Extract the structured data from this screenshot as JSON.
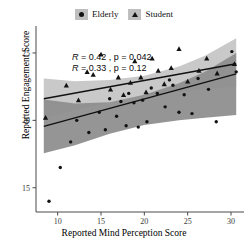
{
  "legend": {
    "entries": [
      {
        "label": "Elderly",
        "marker": "circle-marker-icon",
        "color": "#121212",
        "key_bg": "#bfbfbf"
      },
      {
        "label": "Student",
        "marker": "triangle-marker-icon",
        "color": "#121212",
        "key_bg": "#bfbfbf"
      }
    ]
  },
  "annotations": [
    {
      "text": "R = 0.42 , p = 0.042",
      "r": 0.42,
      "p": 0.042,
      "group": "Student"
    },
    {
      "text": "R = 0.33 , p = 0.12",
      "r": 0.33,
      "p": 0.12,
      "group": "Elderly"
    }
  ],
  "axes": {
    "xlabel": "Reported Mind Perception Score",
    "ylabel": "Reported Engagement Score",
    "xticks": [
      10,
      15,
      20,
      25,
      30
    ],
    "yticks": [
      15,
      20,
      25
    ],
    "xlim": [
      7.5,
      31.5
    ],
    "ylim": [
      13.2,
      27.0
    ]
  },
  "chart_data": {
    "type": "scatter",
    "title": "",
    "xlabel": "Reported Mind Perception Score",
    "ylabel": "Reported Engagement Score",
    "xlim": [
      7.5,
      31.5
    ],
    "ylim": [
      13.2,
      27.0
    ],
    "xticks": [
      10,
      15,
      20,
      25,
      30
    ],
    "yticks": [
      15,
      20,
      25
    ],
    "grid": false,
    "legend_position": "top-center",
    "series": [
      {
        "name": "Elderly",
        "marker": "circle",
        "color": "#121212",
        "band_color": "#8f8f8f",
        "line_color": "#111111",
        "r": 0.33,
        "p": 0.12,
        "fit_line": {
          "x": [
            8.4,
            30.6
          ],
          "y": [
            19.55,
            23.45
          ]
        },
        "band_upper": {
          "x": [
            8.4,
            12.0,
            16.0,
            20.0,
            24.0,
            27.0,
            30.6
          ],
          "y": [
            21.55,
            21.25,
            21.35,
            21.9,
            22.75,
            23.6,
            25.0
          ]
        },
        "band_lower": {
          "x": [
            8.4,
            12.0,
            16.0,
            20.0,
            24.0,
            27.0,
            30.6
          ],
          "y": [
            17.55,
            18.15,
            19.0,
            19.65,
            20.0,
            20.2,
            20.4
          ]
        },
        "points": [
          [
            9.0,
            14.0
          ],
          [
            10.3,
            16.5
          ],
          [
            11.5,
            18.4
          ],
          [
            12.2,
            20.0
          ],
          [
            13.6,
            19.1
          ],
          [
            14.8,
            20.6
          ],
          [
            15.5,
            19.3
          ],
          [
            16.0,
            21.6
          ],
          [
            16.8,
            20.3
          ],
          [
            17.3,
            21.4
          ],
          [
            17.9,
            19.6
          ],
          [
            18.2,
            22.0
          ],
          [
            18.8,
            21.3
          ],
          [
            19.3,
            19.5
          ],
          [
            19.8,
            21.5
          ],
          [
            20.3,
            19.9
          ],
          [
            20.8,
            22.4
          ],
          [
            21.5,
            22.0
          ],
          [
            22.4,
            21.0
          ],
          [
            22.9,
            23.0
          ],
          [
            23.3,
            22.6
          ],
          [
            24.0,
            20.6
          ],
          [
            24.6,
            21.9
          ],
          [
            25.5,
            20.5
          ],
          [
            26.2,
            23.1
          ],
          [
            27.4,
            22.3
          ],
          [
            28.3,
            19.9
          ],
          [
            30.1,
            25.1
          ],
          [
            30.6,
            23.6
          ]
        ]
      },
      {
        "name": "Student",
        "marker": "triangle",
        "color": "#121212",
        "band_color": "#c6c6c6",
        "line_color": "#111111",
        "r": 0.42,
        "p": 0.042,
        "fit_line": {
          "x": [
            8.4,
            30.6
          ],
          "y": [
            21.6,
            24.2
          ]
        },
        "band_upper": {
          "x": [
            8.4,
            12.0,
            16.0,
            20.0,
            24.0,
            27.0,
            30.6
          ],
          "y": [
            23.1,
            22.9,
            23.0,
            23.3,
            24.0,
            24.8,
            26.1
          ]
        },
        "band_lower": {
          "x": [
            8.4,
            12.0,
            16.0,
            20.0,
            24.0,
            27.0,
            30.6
          ],
          "y": [
            20.1,
            20.75,
            21.3,
            21.8,
            22.1,
            22.3,
            22.5
          ]
        },
        "points": [
          [
            8.6,
            20.2
          ],
          [
            11.0,
            22.6
          ],
          [
            12.4,
            21.5
          ],
          [
            13.4,
            23.6
          ],
          [
            14.1,
            23.4
          ],
          [
            15.0,
            24.9
          ],
          [
            16.1,
            22.3
          ],
          [
            17.0,
            23.2
          ],
          [
            17.6,
            21.9
          ],
          [
            18.4,
            22.8
          ],
          [
            18.9,
            24.4
          ],
          [
            19.6,
            23.2
          ],
          [
            20.2,
            22.1
          ],
          [
            20.9,
            24.6
          ],
          [
            21.6,
            23.7
          ],
          [
            22.3,
            22.7
          ],
          [
            23.1,
            23.9
          ],
          [
            24.0,
            25.3
          ],
          [
            25.0,
            22.9
          ],
          [
            26.3,
            23.7
          ],
          [
            27.2,
            24.6
          ],
          [
            28.4,
            23.5
          ],
          [
            30.4,
            24.2
          ]
        ]
      }
    ]
  }
}
